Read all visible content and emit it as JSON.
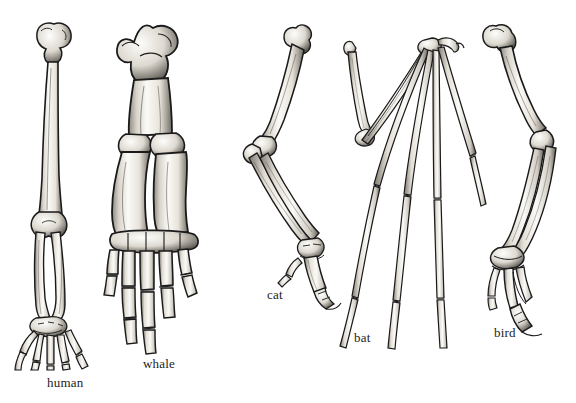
{
  "figure": {
    "background_color": "#ffffff",
    "ink_color": "#1a1a1a",
    "bone_fill_color": "#f2efe9",
    "shadow_color": "#6e6a64",
    "width": 576,
    "height": 403,
    "style": "pen-and-ink scientific illustration"
  },
  "specimens": [
    {
      "id": "human",
      "label": "human",
      "limb": "arm",
      "bones": [
        "humerus",
        "radius",
        "ulna",
        "carpals",
        "metacarpals",
        "phalanges"
      ],
      "digit_count": 5,
      "orientation": "vertical, palm forward",
      "label_x": 47,
      "label_y": 376
    },
    {
      "id": "whale",
      "label": "whale",
      "limb": "flipper",
      "bones": [
        "humerus",
        "radius",
        "ulna",
        "carpals",
        "metacarpals",
        "phalanges"
      ],
      "digit_count": 5,
      "orientation": "vertical, broad and shortened",
      "label_x": 143,
      "label_y": 357
    },
    {
      "id": "cat",
      "label": "cat",
      "limb": "foreleg",
      "bones": [
        "humerus",
        "radius",
        "ulna",
        "carpals",
        "metacarpals",
        "phalanges"
      ],
      "digit_count": 5,
      "orientation": "angled, bent at elbow",
      "label_x": 267,
      "label_y": 288
    },
    {
      "id": "bat",
      "label": "bat",
      "limb": "wing",
      "bones": [
        "humerus",
        "radius",
        "ulna",
        "carpals",
        "metacarpals",
        "phalanges"
      ],
      "digit_count": 5,
      "orientation": "folded, elongated finger bones splayed downward",
      "label_x": 354,
      "label_y": 331
    },
    {
      "id": "bird",
      "label": "bird",
      "limb": "wing",
      "bones": [
        "humerus",
        "radius",
        "ulna",
        "carpals",
        "metacarpals",
        "phalanges"
      ],
      "digit_count": 3,
      "orientation": "angled, bent at elbow and wrist",
      "label_x": 494,
      "label_y": 326
    }
  ]
}
